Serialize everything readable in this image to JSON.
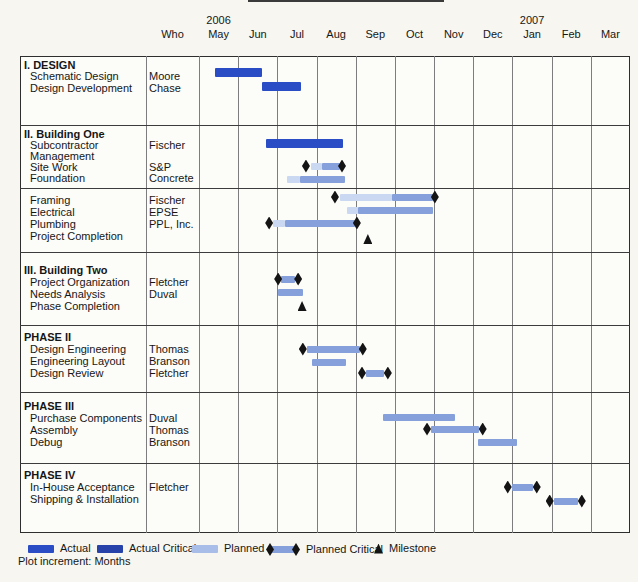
{
  "footer": "Plot increment: Months",
  "header": {
    "who_label": "Who",
    "months": [
      "May",
      "Jun",
      "Jul",
      "Aug",
      "Sep",
      "Oct",
      "Nov",
      "Dec",
      "Jan",
      "Feb",
      "Mar"
    ],
    "year_markers": [
      {
        "label": "2006",
        "at_month": 0
      },
      {
        "label": "2007",
        "at_month": 8
      }
    ]
  },
  "legend": {
    "items": [
      {
        "kind": "actual",
        "label": "Actual",
        "x": 28
      },
      {
        "kind": "actual_critical",
        "label": "Actual Critical",
        "x": 97
      },
      {
        "kind": "planned",
        "label": "Planned",
        "x": 192
      },
      {
        "kind": "planned_critical",
        "label": "Planned Critical",
        "x": 266
      },
      {
        "kind": "milestone",
        "label": "Milestone",
        "x": 374
      }
    ],
    "y": 549
  },
  "colors": {
    "actual": "#2a4cc4",
    "actual_critical": "#2742a8",
    "planned": "#a9bde9",
    "medium": "#85a0da",
    "light": "#cad8f2",
    "milestone": "#141414",
    "grid": "#7d7d7d",
    "border": "#2e2e2e"
  },
  "chart_data": {
    "type": "bar",
    "variant": "gantt",
    "time_axis": {
      "unit": "months",
      "start_label": "May 2006",
      "end_label": "Mar 2007"
    },
    "sections": [
      {
        "title": "I. DESIGN",
        "title_y": 60,
        "top": 56,
        "bottom": 125,
        "rows": [
          {
            "task": "Schematic Design",
            "who": "Moore",
            "text_y": 71,
            "bar": {
              "kind": "actual",
              "cy": 72,
              "start": 0.4,
              "end": 1.6
            }
          },
          {
            "task": "Design Development",
            "who": "Chase",
            "text_y": 83,
            "bar": {
              "kind": "actual",
              "cy": 86,
              "start": 1.6,
              "end": 2.6
            }
          }
        ]
      },
      {
        "title": "II. Building One",
        "title_y": 129,
        "top": 125,
        "bottom": 188,
        "rows": [
          {
            "task": "Subcontractor",
            "who": "Fischer",
            "text_y": 140,
            "bar": {
              "kind": "actual",
              "cy": 143,
              "start": 1.7,
              "end": 3.67
            }
          },
          {
            "task": "Management",
            "who": "",
            "text_y": 151
          },
          {
            "task": "Site Work",
            "who": "S&P",
            "text_y": 162,
            "bar": {
              "kind": "planned_critical",
              "cy": 166,
              "d1": 2.73,
              "d2": 3.65,
              "segments": [
                {
                  "from": 2.85,
                  "to": 3.15,
                  "tone": "light"
                },
                {
                  "from": 3.15,
                  "to": 3.6,
                  "tone": "medium"
                }
              ]
            }
          },
          {
            "task": "Foundation",
            "who": "Concrete",
            "text_y": 173,
            "bar": {
              "kind": "planned",
              "cy": 179,
              "segments": [
                {
                  "from": 2.24,
                  "to": 2.58,
                  "tone": "light"
                },
                {
                  "from": 2.58,
                  "to": 3.72,
                  "tone": "medium"
                }
              ]
            }
          }
        ]
      },
      {
        "title": "",
        "top": 188,
        "bottom": 252,
        "rows": [
          {
            "task": "Framing",
            "who": "Fischer",
            "text_y": 195,
            "bar": {
              "kind": "planned_critical",
              "cy": 197,
              "d1": 3.47,
              "d2": 6.02,
              "segments": [
                {
                  "from": 3.6,
                  "to": 4.92,
                  "tone": "light"
                },
                {
                  "from": 4.92,
                  "to": 5.97,
                  "tone": "medium"
                }
              ]
            }
          },
          {
            "task": "Electrical",
            "who": "EPSE",
            "text_y": 207,
            "bar": {
              "kind": "planned",
              "cy": 210,
              "segments": [
                {
                  "from": 3.78,
                  "to": 4.05,
                  "tone": "light"
                },
                {
                  "from": 4.05,
                  "to": 5.97,
                  "tone": "medium"
                }
              ]
            }
          },
          {
            "task": "Plumbing",
            "who": "PPL, Inc.",
            "text_y": 219,
            "bar": {
              "kind": "planned_critical",
              "cy": 223,
              "d1": 1.79,
              "d2": 4.03,
              "segments": [
                {
                  "from": 1.9,
                  "to": 2.2,
                  "tone": "light"
                },
                {
                  "from": 2.2,
                  "to": 3.97,
                  "tone": "medium"
                }
              ]
            }
          },
          {
            "task": "Project Completion",
            "who": "",
            "text_y": 231,
            "milestone": {
              "at": 4.31,
              "cy": 239
            }
          }
        ]
      },
      {
        "title": "III. Building Two",
        "title_y": 265,
        "top": 252,
        "bottom": 325,
        "rows": [
          {
            "task": "Project Organization",
            "who": "Fletcher",
            "text_y": 277,
            "bar": {
              "kind": "planned_critical",
              "cy": 279,
              "d1": 2.02,
              "d2": 2.53,
              "segments": [
                {
                  "from": 2.1,
                  "to": 2.45,
                  "tone": "medium"
                }
              ]
            }
          },
          {
            "task": "Needs Analysis",
            "who": "Duval",
            "text_y": 289,
            "bar": {
              "kind": "planned",
              "cy": 292,
              "segments": [
                {
                  "from": 2.02,
                  "to": 2.65,
                  "tone": "medium"
                }
              ]
            }
          },
          {
            "task": "Phase Completion",
            "who": "",
            "text_y": 301,
            "milestone": {
              "at": 2.63,
              "cy": 306
            }
          }
        ]
      },
      {
        "title": "PHASE II",
        "title_y": 332,
        "top": 325,
        "bottom": 392,
        "rows": [
          {
            "task": "Design Engineering",
            "who": "Thomas",
            "text_y": 344,
            "bar": {
              "kind": "planned_critical",
              "cy": 349,
              "d1": 2.65,
              "d2": 4.18,
              "segments": [
                {
                  "from": 2.75,
                  "to": 4.1,
                  "tone": "medium"
                }
              ]
            }
          },
          {
            "task": "Engineering Layout",
            "who": "Branson",
            "text_y": 356,
            "bar": {
              "kind": "planned",
              "cy": 362,
              "segments": [
                {
                  "from": 2.88,
                  "to": 3.75,
                  "tone": "medium"
                }
              ]
            }
          },
          {
            "task": "Design Review",
            "who": "Fletcher",
            "text_y": 368,
            "bar": {
              "kind": "planned_critical",
              "cy": 373,
              "d1": 4.16,
              "d2": 4.82,
              "segments": [
                {
                  "from": 4.26,
                  "to": 4.72,
                  "tone": "medium"
                }
              ]
            }
          }
        ]
      },
      {
        "title": "PHASE III",
        "title_y": 401,
        "top": 392,
        "bottom": 463,
        "rows": [
          {
            "task": "Purchase Components",
            "who": "Duval",
            "text_y": 413,
            "bar": {
              "kind": "planned",
              "cy": 417,
              "segments": [
                {
                  "from": 4.69,
                  "to": 6.53,
                  "tone": "medium"
                }
              ]
            }
          },
          {
            "task": "Assembly",
            "who": "Thomas",
            "text_y": 425,
            "bar": {
              "kind": "planned_critical",
              "cy": 429,
              "d1": 5.82,
              "d2": 7.24,
              "segments": [
                {
                  "from": 5.92,
                  "to": 7.14,
                  "tone": "medium"
                }
              ]
            }
          },
          {
            "task": "Debug",
            "who": "Branson",
            "text_y": 437,
            "bar": {
              "kind": "planned",
              "cy": 442,
              "segments": [
                {
                  "from": 7.12,
                  "to": 8.11,
                  "tone": "medium"
                }
              ]
            }
          }
        ]
      },
      {
        "title": "PHASE IV",
        "title_y": 470,
        "top": 463,
        "bottom": 533,
        "rows": [
          {
            "task": "In-House Acceptance",
            "who": "Fletcher",
            "text_y": 482,
            "bar": {
              "kind": "planned_critical",
              "cy": 487,
              "d1": 7.88,
              "d2": 8.62,
              "segments": [
                {
                  "from": 7.98,
                  "to": 8.52,
                  "tone": "medium"
                }
              ]
            }
          },
          {
            "task": "Shipping & Installation",
            "who": "",
            "text_y": 494,
            "bar": {
              "kind": "planned_critical",
              "cy": 501,
              "d1": 8.95,
              "d2": 9.77,
              "segments": [
                {
                  "from": 9.05,
                  "to": 9.67,
                  "tone": "medium"
                }
              ]
            }
          }
        ]
      }
    ]
  }
}
